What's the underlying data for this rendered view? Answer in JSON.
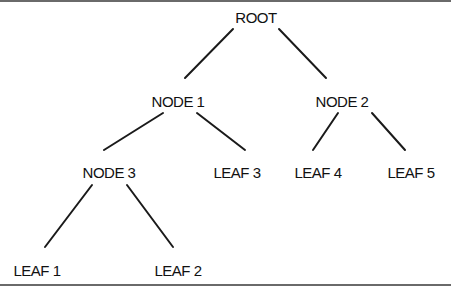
{
  "diagram": {
    "type": "tree",
    "nodes": [
      {
        "id": "root",
        "label": "ROOT",
        "x": 256,
        "y": 17
      },
      {
        "id": "node1",
        "label": "NODE 1",
        "x": 178,
        "y": 101
      },
      {
        "id": "node2",
        "label": "NODE 2",
        "x": 342,
        "y": 101
      },
      {
        "id": "node3",
        "label": "NODE 3",
        "x": 109,
        "y": 172
      },
      {
        "id": "leaf3",
        "label": "LEAF 3",
        "x": 237,
        "y": 172
      },
      {
        "id": "leaf4",
        "label": "LEAF 4",
        "x": 318,
        "y": 172
      },
      {
        "id": "leaf5",
        "label": "LEAF 5",
        "x": 411,
        "y": 172
      },
      {
        "id": "leaf1",
        "label": "LEAF 1",
        "x": 37,
        "y": 270
      },
      {
        "id": "leaf2",
        "label": "LEAF 2",
        "x": 178,
        "y": 270
      }
    ],
    "edges": [
      {
        "from": "root",
        "to": "node1"
      },
      {
        "from": "root",
        "to": "node2"
      },
      {
        "from": "node1",
        "to": "node3"
      },
      {
        "from": "node1",
        "to": "leaf3"
      },
      {
        "from": "node2",
        "to": "leaf4"
      },
      {
        "from": "node2",
        "to": "leaf5"
      },
      {
        "from": "node3",
        "to": "leaf1"
      },
      {
        "from": "node3",
        "to": "leaf2"
      }
    ]
  }
}
